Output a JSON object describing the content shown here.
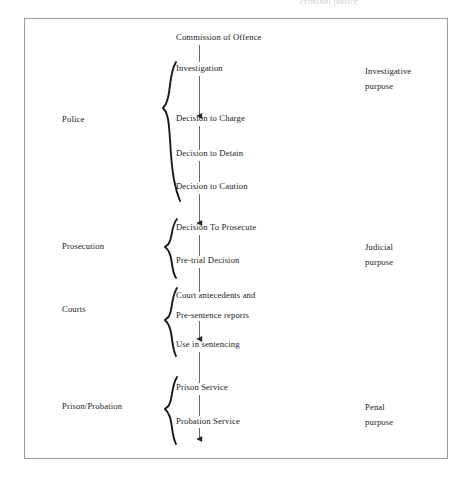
{
  "diagram": {
    "title_cut_off": "criminal justice",
    "frame": {
      "border_color": "#9a9a9a"
    },
    "agency_labels": [
      {
        "name": "police",
        "text": "Police"
      },
      {
        "name": "prosecution",
        "text": "Prosecution"
      },
      {
        "name": "courts",
        "text": "Courts"
      },
      {
        "name": "prison-probation",
        "text": "Prison/Probation"
      }
    ],
    "flow_nodes": [
      {
        "name": "commission-of-offence",
        "text": "Commission of Offence"
      },
      {
        "name": "investigation",
        "text": "Investigation"
      },
      {
        "name": "decision-to-charge",
        "text": "Decision to Charge"
      },
      {
        "name": "decision-to-detain",
        "text": "Decision to Detain"
      },
      {
        "name": "decision-to-caution",
        "text": "Decision to Caution"
      },
      {
        "name": "decision-to-prosecute",
        "text": "Decision To Prosecute"
      },
      {
        "name": "pre-trial-decision",
        "text": "Pre-trial Decision"
      },
      {
        "name": "court-antecedents",
        "text": "Court antecedents and"
      },
      {
        "name": "pre-sentence-reports",
        "text": "Pre-sentence reports"
      },
      {
        "name": "use-in-sentencing",
        "text": "Use in sentencing"
      },
      {
        "name": "prison-service",
        "text": "Prison Service"
      },
      {
        "name": "probation-service",
        "text": "Probation Service"
      }
    ],
    "purpose_labels": [
      {
        "name": "investigative-purpose",
        "line1": "Investigative",
        "line2": "purpose"
      },
      {
        "name": "judicial-purpose",
        "line1": "Judicial",
        "line2": "purpose"
      },
      {
        "name": "penal-purpose",
        "line1": "Penal",
        "line2": "purpose"
      }
    ],
    "colors": {
      "ink": "#1a1a1a",
      "connector": "#444444",
      "frame": "#9a9a9a",
      "faint": "#c9c9c9"
    }
  }
}
